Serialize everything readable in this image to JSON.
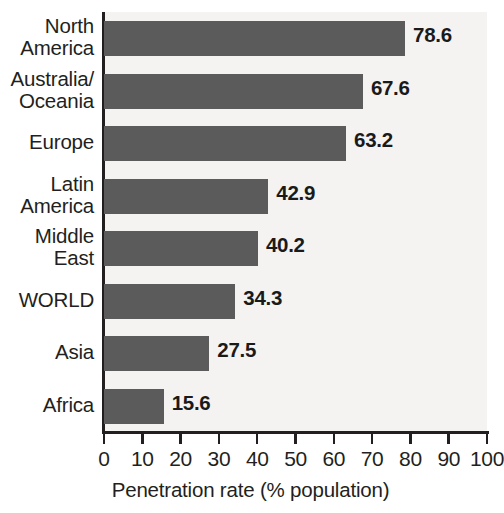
{
  "chart_data": {
    "type": "bar",
    "orientation": "horizontal",
    "title": "",
    "xlabel": "Penetration rate (% population)",
    "ylabel": "",
    "xlim": [
      0,
      100
    ],
    "xticks": [
      0,
      10,
      20,
      30,
      40,
      50,
      60,
      70,
      80,
      90,
      100
    ],
    "xtick_labels": [
      "0",
      "10",
      "20",
      "30",
      "40",
      "50",
      "60",
      "70",
      "80",
      "90",
      "100"
    ],
    "grid": false,
    "legend": null,
    "categories": [
      "North\nAmerica",
      "Australia/\nOceania",
      "Europe",
      "Latin\nAmerica",
      "Middle\nEast",
      "WORLD",
      "Asia",
      "Africa"
    ],
    "values": [
      78.6,
      67.6,
      63.2,
      42.9,
      40.2,
      34.3,
      27.5,
      15.6
    ],
    "value_labels": [
      "78.6",
      "67.6",
      "63.2",
      "42.9",
      "40.2",
      "34.3",
      "27.5",
      "15.6"
    ],
    "bar_color": "#5b5b5b",
    "plot_background": "#f4f3f1",
    "axis_color": "#231f20"
  }
}
